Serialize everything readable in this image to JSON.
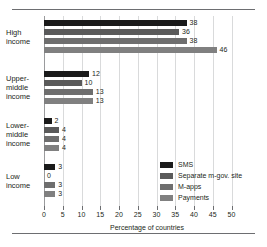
{
  "chart_data": {
    "type": "bar",
    "orientation": "horizontal",
    "title": "",
    "subtitle": "",
    "xlabel": "Percentage of countries",
    "ylabel": "",
    "xlim": [
      0,
      50
    ],
    "xticks": [
      0,
      5,
      10,
      15,
      20,
      25,
      30,
      35,
      40,
      45,
      50
    ],
    "xtick_labels": [
      "0",
      "5",
      "10",
      "15",
      "20",
      "25",
      "30",
      "35",
      "40",
      "45",
      "50"
    ],
    "grid": "vertical",
    "legend_position": "inside-lower-right",
    "categories": [
      "High income",
      "Upper-middle income",
      "Lower-middle income",
      "Low income"
    ],
    "category_label_lines": [
      [
        "High",
        "income"
      ],
      [
        "Upper-",
        "middle",
        "income"
      ],
      [
        "Lower-",
        "middle",
        "income"
      ],
      [
        "Low",
        "income"
      ]
    ],
    "series": [
      {
        "name": "SMS",
        "color": "#1a1a1a",
        "values": [
          38,
          12,
          2,
          3
        ],
        "labels": [
          "38",
          "12",
          "2",
          "3"
        ]
      },
      {
        "name": "Separate m-gov. site",
        "color": "#5a5a5a",
        "values": [
          36,
          10,
          4,
          0
        ],
        "labels": [
          "36",
          "10",
          "4",
          "0"
        ]
      },
      {
        "name": "M-apps",
        "color": "#6e6e6e",
        "values": [
          38,
          13,
          4,
          3
        ],
        "labels": [
          "38",
          "13",
          "4",
          "3"
        ]
      },
      {
        "name": "Payments",
        "color": "#808080",
        "values": [
          46,
          13,
          4,
          3
        ],
        "labels": [
          "46",
          "13",
          "4",
          "3"
        ]
      }
    ]
  },
  "colors": {
    "gridline": "#d9dadb",
    "axis": "#6d6e71",
    "rule": "#6d6e71",
    "text": "#231f20",
    "background": "#ffffff"
  }
}
